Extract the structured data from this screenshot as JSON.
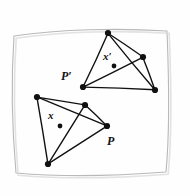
{
  "figure": {
    "background_color": "#fefefe",
    "ink_color": "#111111",
    "border_color": "#b8b8b8",
    "width": 190,
    "height": 196
  },
  "paper_border": {
    "name": "hand-drawn-frame",
    "path": "M 14 36 C 60 29, 120 28, 167 31 C 169 80, 170 130, 166 172 C 115 176, 62 177, 16 173 C 12 128, 11 80, 14 36 Z"
  },
  "labels": [
    {
      "id": "p-prime",
      "text": "P′",
      "x": 61,
      "y": 70,
      "kind": "point-set-label"
    },
    {
      "id": "p",
      "text": "P",
      "x": 107,
      "y": 135,
      "kind": "point-set-label"
    },
    {
      "id": "x-prime",
      "text": "x′",
      "x": 103,
      "y": 51,
      "kind": "point-label"
    },
    {
      "id": "x",
      "text": "x",
      "x": 48,
      "y": 110,
      "kind": "point-label"
    }
  ],
  "shapes": [
    {
      "id": "upper-set",
      "name": "point-set-p-prime",
      "label": "P′",
      "vertices": [
        {
          "id": "v1",
          "x": 108,
          "y": 33
        },
        {
          "id": "v2",
          "x": 143,
          "y": 57
        },
        {
          "id": "v3",
          "x": 155,
          "y": 90
        },
        {
          "id": "v4",
          "x": 83,
          "y": 87
        }
      ],
      "edges": [
        [
          0,
          1
        ],
        [
          1,
          2
        ],
        [
          2,
          3
        ],
        [
          3,
          0
        ],
        [
          0,
          2
        ],
        [
          1,
          3
        ]
      ],
      "interior_point": {
        "id": "x-prime-dot",
        "x": 114,
        "y": 66,
        "label": "x′"
      }
    },
    {
      "id": "lower-set",
      "name": "point-set-p",
      "label": "P",
      "vertices": [
        {
          "id": "w1",
          "x": 37,
          "y": 97
        },
        {
          "id": "w2",
          "x": 85,
          "y": 105
        },
        {
          "id": "w3",
          "x": 107,
          "y": 126
        },
        {
          "id": "w4",
          "x": 48,
          "y": 164
        }
      ],
      "edges": [
        [
          0,
          1
        ],
        [
          1,
          2
        ],
        [
          2,
          3
        ],
        [
          3,
          0
        ],
        [
          0,
          2
        ],
        [
          1,
          3
        ]
      ],
      "interior_point": {
        "id": "x-dot",
        "x": 60,
        "y": 126,
        "label": "x"
      }
    }
  ],
  "style": {
    "stroke_width": 1.4,
    "vertex_radius": 3.1,
    "interior_point_radius": 2.4
  }
}
